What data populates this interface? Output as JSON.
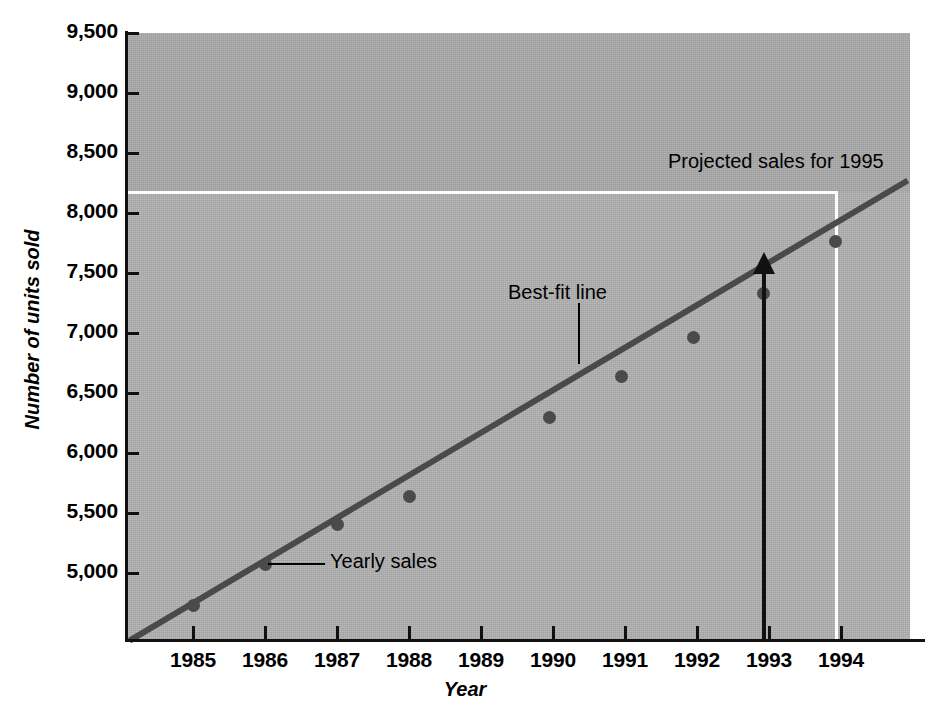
{
  "chart_data": {
    "type": "scatter",
    "title": "",
    "xlabel": "Year",
    "ylabel": "Number of units sold",
    "x": [
      1985,
      1986,
      1987,
      1988,
      1989,
      1990,
      1991,
      1992,
      1993
    ],
    "values": [
      4775,
      5145,
      5635,
      5870,
      6295,
      6655,
      6955,
      7320,
      7750
    ],
    "categories": [
      "1985",
      "1986",
      "1987",
      "1988",
      "1989",
      "1990",
      "1991",
      "1992",
      "1993"
    ],
    "series": [
      {
        "name": "Yearly sales",
        "values": [
          4775,
          5145,
          5635,
          5870,
          6295,
          6655,
          6955,
          7320,
          7750
        ]
      },
      {
        "name": "Best-fit line",
        "type": "line",
        "endpoints": [
          {
            "x": 1984.25,
            "y": 4380
          },
          {
            "x": 1994.9,
            "y": 8420
          }
        ]
      }
    ],
    "xlim": [
      1984.25,
      1995.0
    ],
    "ylim": [
      4380,
      9500
    ],
    "xticks": [
      "1985",
      "1986",
      "1987",
      "1988",
      "1989",
      "1990",
      "1991",
      "1992",
      "1993",
      "1994"
    ],
    "yticks": [
      "5,000",
      "5,500",
      "6,000",
      "6,500",
      "7,000",
      "7,500",
      "8,000",
      "8,500",
      "9,000",
      "9,500"
    ],
    "grid": false,
    "legend": "none",
    "projection": {
      "label": "Projected sales for 1995",
      "value": 8170,
      "reference_year": 1994
    },
    "annotations": [
      {
        "text": "Projected sales for 1995",
        "kind": "projection-label"
      },
      {
        "text": "Best-fit line",
        "kind": "line-label"
      },
      {
        "text": "Yearly sales",
        "kind": "point-label"
      }
    ]
  },
  "axes": {
    "x_title": "Year",
    "y_title": "Number of units sold",
    "y_ticks": [
      "9,500",
      "9,000",
      "8,500",
      "8,000",
      "7,500",
      "7,000",
      "6,500",
      "6,000",
      "5,500",
      "5,000"
    ],
    "x_ticks": [
      "1985",
      "1986",
      "1987",
      "1988",
      "1989",
      "1990",
      "1991",
      "1992",
      "1993",
      "1994"
    ]
  },
  "annotations": {
    "projected": "Projected sales for 1995",
    "bestfit": "Best-fit line",
    "yearly": "Yearly sales"
  },
  "colors": {
    "plot_background": "#b2b2b2",
    "plot_background_upper": "#ababab",
    "line": "#4a4a4a",
    "marker": "#4a4a4a",
    "axis": "#111111",
    "guide": "#ffffff",
    "text": "#000000",
    "page_background": "#ffffff"
  }
}
